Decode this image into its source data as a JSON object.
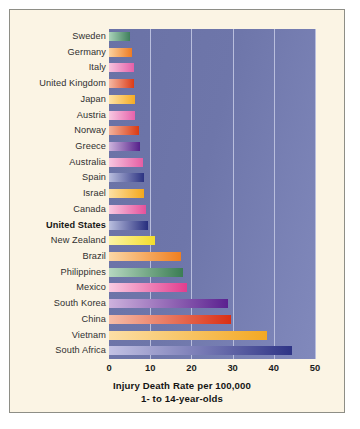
{
  "chart_data": {
    "type": "bar",
    "orientation": "horizontal",
    "title": "Injury Death Rate per 100,000",
    "subtitle": "1- to 14-year-olds",
    "xlabel": "Injury Death Rate per 100,000",
    "ylabel": "",
    "xlim": [
      0,
      50
    ],
    "xticks": [
      0,
      10,
      20,
      30,
      40,
      50
    ],
    "xtick_labels": [
      "0",
      "10",
      "20",
      "30",
      "40",
      "50"
    ],
    "grid": true,
    "legend": false,
    "highlighted_category": "United States",
    "categories": [
      "Sweden",
      "Germany",
      "Italy",
      "United Kingdom",
      "Japan",
      "Austria",
      "Norway",
      "Greece",
      "Australia",
      "Spain",
      "Israel",
      "Canada",
      "United States",
      "New Zealand",
      "Brazil",
      "Philippines",
      "Mexico",
      "South Korea",
      "China",
      "Vietnam",
      "South Africa"
    ],
    "values": [
      5.1,
      5.6,
      6.0,
      6.1,
      6.2,
      6.3,
      7.4,
      7.5,
      8.3,
      8.4,
      8.5,
      9.0,
      9.4,
      11.2,
      17.5,
      18.0,
      19.0,
      29.0,
      29.5,
      38.4,
      44.5
    ],
    "bars": [
      {
        "category": "Sweden",
        "value": 5.1,
        "color_start": "#aad3ba",
        "color_end": "#3f7f5c"
      },
      {
        "category": "Germany",
        "value": 5.6,
        "color_start": "#fbd2a0",
        "color_end": "#ef7b22"
      },
      {
        "category": "Italy",
        "value": 6.0,
        "color_start": "#f6c3de",
        "color_end": "#e45fa8"
      },
      {
        "category": "United Kingdom",
        "value": 6.1,
        "color_start": "#f4b9a4",
        "color_end": "#db3b17"
      },
      {
        "category": "Japan",
        "value": 6.2,
        "color_start": "#fde3a8",
        "color_end": "#f5ab23"
      },
      {
        "category": "Austria",
        "value": 6.3,
        "color_start": "#f7c8e1",
        "color_end": "#e662ab"
      },
      {
        "category": "Norway",
        "value": 7.4,
        "color_start": "#f2b29c",
        "color_end": "#d93a13"
      },
      {
        "category": "Greece",
        "value": 7.5,
        "color_start": "#cdb4dd",
        "color_end": "#56218b"
      },
      {
        "category": "Australia",
        "value": 8.3,
        "color_start": "#f7c7e0",
        "color_end": "#e55ea4"
      },
      {
        "category": "Spain",
        "value": 8.4,
        "color_start": "#b9bede",
        "color_end": "#2c3382"
      },
      {
        "category": "Israel",
        "value": 8.5,
        "color_start": "#fce0a4",
        "color_end": "#f4a81d"
      },
      {
        "category": "Canada",
        "value": 9.0,
        "color_start": "#f8c9e1",
        "color_end": "#e4519b"
      },
      {
        "category": "United States",
        "value": 9.4,
        "color_start": "#babfdf",
        "color_end": "#272e7e"
      },
      {
        "category": "New Zealand",
        "value": 11.2,
        "color_start": "#fbf3a6",
        "color_end": "#f3dd2b"
      },
      {
        "category": "Brazil",
        "value": 17.5,
        "color_start": "#fbd7a6",
        "color_end": "#f07f20"
      },
      {
        "category": "Philippines",
        "value": 18.0,
        "color_start": "#b6d8c0",
        "color_end": "#3b7d54"
      },
      {
        "category": "Mexico",
        "value": 19.0,
        "color_start": "#f9cbe2",
        "color_end": "#e23d8e"
      },
      {
        "category": "South Korea",
        "value": 29.0,
        "color_start": "#cdb2dd",
        "color_end": "#5b2190"
      },
      {
        "category": "China",
        "value": 29.5,
        "color_start": "#f6bda8",
        "color_end": "#da2f14"
      },
      {
        "category": "Vietnam",
        "value": 38.4,
        "color_start": "#fcdfa6",
        "color_end": "#f3a823"
      },
      {
        "category": "South Africa",
        "value": 44.5,
        "color_start": "#c3c2e4",
        "color_end": "#2e3486"
      }
    ],
    "colors": {
      "plot_background_left": "#6a72a6",
      "plot_background_right": "#8189bc",
      "gridline": "#b9bedd",
      "figure_background": "#fbf4e4",
      "figure_border": "#8e8e86",
      "page_background": "#ffffff",
      "label_text": "#2f2f2f"
    }
  }
}
